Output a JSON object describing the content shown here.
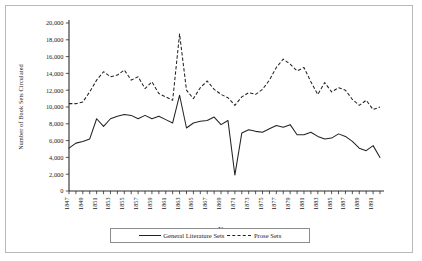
{
  "chart_data": {
    "type": "line",
    "title": "",
    "xlabel": "Year",
    "ylabel": "Number of Book Sets Circulated",
    "xlim": [
      1847,
      1892
    ],
    "ylim": [
      0,
      20000
    ],
    "ytick_step": 2000,
    "grid": false,
    "legend_position": "bottom-center",
    "ytick_labels": [
      "0",
      "2,000",
      "4,000",
      "6,000",
      "8,000",
      "10,000",
      "12,000",
      "14,000",
      "16,000",
      "18,000",
      "20,000"
    ],
    "ytick_values": [
      0,
      2000,
      4000,
      6000,
      8000,
      10000,
      12000,
      14000,
      16000,
      18000,
      20000
    ],
    "x": [
      1847,
      1848,
      1849,
      1850,
      1851,
      1852,
      1853,
      1854,
      1855,
      1856,
      1857,
      1858,
      1859,
      1860,
      1861,
      1862,
      1863,
      1864,
      1865,
      1866,
      1867,
      1868,
      1869,
      1870,
      1871,
      1872,
      1873,
      1874,
      1875,
      1876,
      1877,
      1878,
      1879,
      1880,
      1881,
      1882,
      1883,
      1884,
      1885,
      1886,
      1887,
      1888,
      1889,
      1890,
      1891,
      1892
    ],
    "xtick_labels": [
      "1847",
      "1849",
      "1851",
      "1853",
      "1855",
      "1857",
      "1859",
      "1861",
      "1863",
      "1865",
      "1867",
      "1869",
      "1871",
      "1873",
      "1875",
      "1877",
      "1879",
      "1881",
      "1883",
      "1885",
      "1887",
      "1889",
      "1891"
    ],
    "xtick_values": [
      1847,
      1849,
      1851,
      1853,
      1855,
      1857,
      1859,
      1861,
      1863,
      1865,
      1867,
      1869,
      1871,
      1873,
      1875,
      1877,
      1879,
      1881,
      1883,
      1885,
      1887,
      1889,
      1891
    ],
    "series": [
      {
        "name": "General Literature Sets",
        "style": "solid",
        "color": "#232323",
        "values": [
          5100,
          5700,
          5900,
          6200,
          8600,
          7700,
          8600,
          8900,
          9100,
          9000,
          8600,
          9000,
          8600,
          8900,
          8500,
          8100,
          11400,
          7500,
          8100,
          8300,
          8400,
          8800,
          7900,
          8400,
          1900,
          6900,
          7300,
          7100,
          7000,
          7400,
          7800,
          7600,
          7900,
          6700,
          6700,
          7000,
          6500,
          6200,
          6300,
          6800,
          6500,
          5900,
          5100,
          4800,
          5400,
          4000
        ]
      },
      {
        "name": "Prose Sets",
        "style": "dashed",
        "color": "#232323",
        "values": [
          10400,
          10400,
          10600,
          11800,
          13200,
          14200,
          13600,
          13800,
          14400,
          13200,
          13600,
          12200,
          13000,
          11600,
          11200,
          10800,
          18700,
          12000,
          11000,
          12300,
          13100,
          12100,
          11500,
          11100,
          10200,
          11200,
          11700,
          11500,
          12100,
          13200,
          14700,
          15700,
          15100,
          14300,
          14700,
          13000,
          11500,
          12900,
          11800,
          12300,
          12000,
          10900,
          10200,
          10800,
          9700,
          10000
        ]
      }
    ]
  },
  "legend": {
    "items": [
      {
        "label": "General Literature Sets",
        "style": "solid"
      },
      {
        "label": "Prose Sets",
        "style": "dashed"
      }
    ]
  }
}
